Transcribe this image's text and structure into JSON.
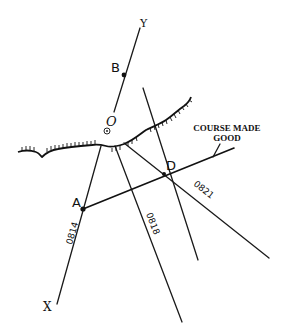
{
  "diagram": {
    "points": {
      "A": {
        "label": "A"
      },
      "B": {
        "label": "B"
      },
      "D": {
        "label": "D"
      },
      "O": {
        "label": "O"
      },
      "X": {
        "label": "X"
      },
      "Y": {
        "label": "Y"
      }
    },
    "bearing_lines": [
      {
        "label": "0814"
      },
      {
        "label": "0818"
      },
      {
        "label": "0821"
      }
    ],
    "annotation": {
      "line1": "COURSE MADE",
      "line2": "GOOD"
    },
    "colors": {
      "ink": "#111111",
      "background": "#ffffff"
    }
  }
}
